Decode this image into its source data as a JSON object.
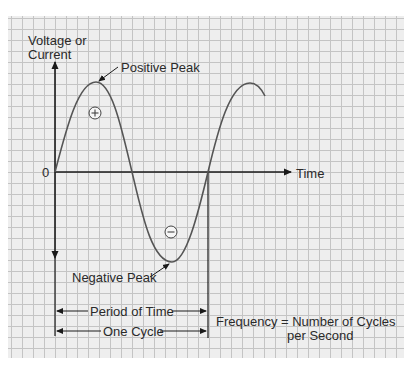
{
  "diagram": {
    "y_axis_label_line1": "Voltage or",
    "y_axis_label_line2": "Current",
    "x_axis_label": "Time",
    "origin_label": "0",
    "positive_peak_label": "Positive Peak",
    "negative_peak_label": "Negative Peak",
    "positive_symbol": "+",
    "negative_symbol": "−",
    "period_label": "Period of Time",
    "cycle_label": "One Cycle",
    "frequency_line1": "Frequency = Number of Cycles",
    "frequency_line2": "per Second",
    "colors": {
      "grid_background": "#eeeeee",
      "grid_lines": "#c4c4c4",
      "axis": "#1a1a1a",
      "curve": "#555555",
      "text": "#2a2a2a"
    }
  }
}
